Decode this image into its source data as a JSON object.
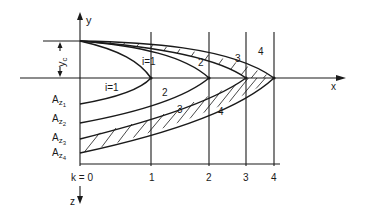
{
  "diagram": {
    "axes": {
      "y_label": "y",
      "x_label": "x",
      "z_label": "z",
      "yc_label": "y",
      "yc_sub": "c"
    },
    "k_ticks": [
      "k = 0",
      "1",
      "2",
      "3",
      "4"
    ],
    "upper_curve_labels": [
      "i=1",
      "2",
      "3",
      "4"
    ],
    "lower_curve_labels": [
      "i=1",
      "2",
      "3",
      "4"
    ],
    "area_labels": [
      {
        "main": "A",
        "sub": "z",
        "subsub": "1"
      },
      {
        "main": "A",
        "sub": "z",
        "subsub": "2"
      },
      {
        "main": "A",
        "sub": "z",
        "subsub": "3"
      },
      {
        "main": "A",
        "sub": "z",
        "subsub": "4"
      }
    ]
  }
}
